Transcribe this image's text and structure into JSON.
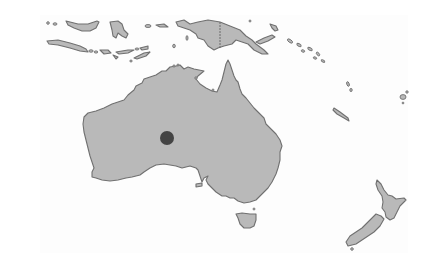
{
  "map": {
    "region": "Australia and Oceania",
    "land_color": "#b9b9b9",
    "coast_color": "#707070",
    "background_color": "#fdfdfd",
    "landmasses": [
      "Australia",
      "Tasmania",
      "New Guinea",
      "Indonesia (Java, Sumatra tip, Lesser Sunda Islands)",
      "Borneo tip",
      "Sulawesi",
      "Solomon Islands",
      "Vanuatu",
      "New Caledonia",
      "Fiji",
      "New Zealand North Island",
      "New Zealand South Island"
    ],
    "marker": {
      "shape": "circle",
      "color": "#444444",
      "location": "central Western Australia"
    }
  }
}
